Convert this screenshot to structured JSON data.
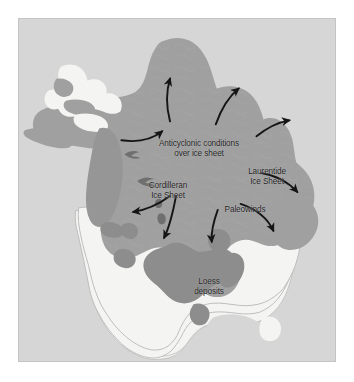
{
  "figure": {
    "kind": "map",
    "panel": {
      "background_color": "#d6d6d6",
      "border_color": "#c4c4c4"
    }
  },
  "map": {
    "regions": [
      {
        "id": "laurentide-ice-sheet",
        "name": "Laurentide Ice Sheet",
        "fill_color": "#a0a0a0",
        "description": "Large mid/dark gray ice mass covering Canada and the northern United States"
      },
      {
        "id": "cordilleran-ice-sheet",
        "name": "Cordilleran Ice Sheet",
        "fill_color": "#9a9a9a",
        "description": "Elongated darker gray strip along the western mountain belt"
      },
      {
        "id": "loess-deposits",
        "name": "Loess deposits",
        "fill_color": "#8f8f8f",
        "description": "Dark gray patches across the central United States south of the ice margin"
      },
      {
        "id": "ice-free-land",
        "name": "Ice-free land",
        "fill_color": "#f4f4f2",
        "description": "Pale near-white unglaciated land of the United States, Mexico and Alaska"
      },
      {
        "id": "ocean",
        "name": "Ocean",
        "fill_color": "#d6d6d6",
        "description": "Light gray background surrounding the continent"
      }
    ],
    "labels": [
      {
        "id": "anticyclonic",
        "text": "Anticyclonic conditions\nover ice sheet",
        "color": "#1b1b1b"
      },
      {
        "id": "laurentide",
        "text": "Laurentide\nIce Sheet",
        "color": "#1b1b1b"
      },
      {
        "id": "cordilleran",
        "text": "Cordilleran\nIce Sheet",
        "color": "#1b1b1b"
      },
      {
        "id": "paleowinds",
        "text": "Paleowinds",
        "color": "#1b1b1b"
      },
      {
        "id": "loess",
        "text": "Loess\ndeposits",
        "color": "#1b1b1b"
      }
    ],
    "arrows": {
      "color": "#151515",
      "count": 9,
      "meaning": "Paleowind flow directions radiating outward from the anticyclone over the ice sheet"
    }
  }
}
